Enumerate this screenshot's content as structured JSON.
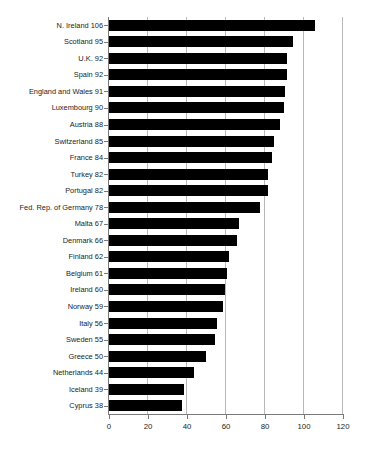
{
  "chart_data": {
    "type": "bar",
    "orientation": "horizontal",
    "title": "",
    "subtitle": "",
    "xlabel": "",
    "ylabel": "",
    "xlim": [
      0,
      120
    ],
    "xticks": [
      0,
      20,
      40,
      60,
      80,
      100,
      120
    ],
    "grid": "vertical",
    "legend": "none",
    "bar_color": "#000000",
    "grid_color": "#b8b8b8",
    "axis_color": "#7a7a7a",
    "categories": [
      "N. Ireland",
      "Scotland",
      "U.K.",
      "Spain",
      "England and Wales",
      "Luxembourg",
      "Austria",
      "Switzerland",
      "France",
      "Turkey",
      "Portugal",
      "Fed. Rep. of Germany",
      "Malta",
      "Denmark",
      "Finland",
      "Belgium",
      "Ireland",
      "Norway",
      "Italy",
      "Sweden",
      "Greece",
      "Netherlands",
      "Iceland",
      "Cyprus"
    ],
    "values": [
      106,
      95,
      92,
      92,
      91,
      90,
      88,
      85,
      84,
      82,
      82,
      78,
      67,
      66,
      62,
      61,
      60,
      59,
      56,
      55,
      50,
      44,
      39,
      38
    ],
    "tick_labels": [
      "N. Ireland 106",
      "Scotland 95",
      "U.K. 92",
      "Spain 92",
      "England and Wales 91",
      "Luxembourg 90",
      "Austria 88",
      "Switzerland 85",
      "France 84",
      "Turkey 82",
      "Portugal 82",
      "Fed. Rep. of Germany 78",
      "Malta 67",
      "Denmark 66",
      "Finland 62",
      "Belgium 61",
      "Ireland 60",
      "Norway 59",
      "Italy 56",
      "Sweden 55",
      "Greece 50",
      "Netherlands 44",
      "Iceland 39",
      "Cyprus 38"
    ],
    "xtick_labels": [
      "0",
      "20",
      "40",
      "60",
      "80",
      "100",
      "120"
    ]
  }
}
